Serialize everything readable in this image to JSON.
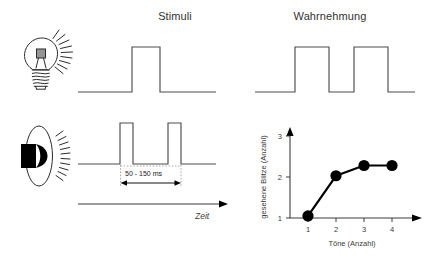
{
  "figure": {
    "titles": {
      "stimuli": "Stimuli",
      "wahrnehmung": "Wahrnehmung"
    },
    "icons": {
      "light": "lightbulb-icon",
      "sound": "loudspeaker-icon"
    },
    "annotations": {
      "interval": "50 - 150 ms",
      "time_axis": "Zeit"
    },
    "traces": {
      "light_stimulus": {
        "name": "light-stimulus-trace",
        "pulses": 1,
        "description": "single square pulse"
      },
      "light_perception": {
        "name": "light-perception-trace",
        "pulses": 2,
        "description": "two wide square pulses"
      },
      "sound_stimulus": {
        "name": "sound-stimulus-trace",
        "pulses": 2,
        "description": "two narrow square pulses"
      }
    }
  },
  "chart_data": {
    "type": "line",
    "title": "",
    "xlabel": "Töne (Anzahl)",
    "ylabel": "gesehene Blitze (Anzahl)",
    "x": [
      1,
      2,
      3,
      4
    ],
    "values": [
      1.05,
      2.03,
      2.28,
      2.28
    ],
    "xticks": [
      "1",
      "2",
      "3",
      "4"
    ],
    "yticks": [
      "1",
      "2",
      "3"
    ],
    "xlim": [
      0.5,
      4.7
    ],
    "ylim": [
      1,
      3
    ],
    "grid": false,
    "legend": false,
    "marker": "filled-circle",
    "series": [
      {
        "name": "gesehene Blitze",
        "values": [
          1.05,
          2.03,
          2.28,
          2.28
        ]
      }
    ]
  },
  "colors": {
    "trace": "#4d4d4d",
    "axis": "#3d3d3d",
    "curve": "#000000",
    "marker": "#000000",
    "text": "#333333",
    "background": "#ffffff"
  }
}
